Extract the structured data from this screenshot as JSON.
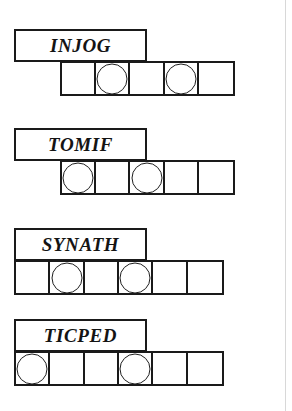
{
  "diagram": {
    "type": "word-cell-grid",
    "cell_size": 35,
    "circle_diameter": 31,
    "sheet_width": 292,
    "sheet_height": 411,
    "colors": {
      "ink": "#1a1a1a",
      "paper": "#ffffff",
      "page_edge": "#d8d8d8"
    },
    "page_edge_x": 285,
    "rows": [
      {
        "id": "row-injog",
        "label": "INJOG",
        "label_box": {
          "x": 14,
          "y": 29,
          "width": 133,
          "height": 33
        },
        "strip": {
          "x": 60,
          "y": 61,
          "cells": 5
        },
        "cells": [
          {
            "index": 1,
            "token": false
          },
          {
            "index": 2,
            "token": true
          },
          {
            "index": 3,
            "token": false
          },
          {
            "index": 4,
            "token": true
          },
          {
            "index": 5,
            "token": false
          }
        ],
        "token_positions": [
          2,
          4
        ],
        "token_count": 2
      },
      {
        "id": "row-tomif",
        "label": "TOMIF",
        "label_box": {
          "x": 14,
          "y": 128,
          "width": 133,
          "height": 33
        },
        "strip": {
          "x": 60,
          "y": 160,
          "cells": 5
        },
        "cells": [
          {
            "index": 1,
            "token": true
          },
          {
            "index": 2,
            "token": false
          },
          {
            "index": 3,
            "token": true
          },
          {
            "index": 4,
            "token": false
          },
          {
            "index": 5,
            "token": false
          }
        ],
        "token_positions": [
          1,
          3
        ],
        "token_count": 2
      },
      {
        "id": "row-synath",
        "label": "SYNATH",
        "label_box": {
          "x": 14,
          "y": 228,
          "width": 133,
          "height": 33
        },
        "strip": {
          "x": 14,
          "y": 260,
          "cells": 6
        },
        "cells": [
          {
            "index": 1,
            "token": false
          },
          {
            "index": 2,
            "token": true
          },
          {
            "index": 3,
            "token": false
          },
          {
            "index": 4,
            "token": true
          },
          {
            "index": 5,
            "token": false
          },
          {
            "index": 6,
            "token": false
          }
        ],
        "token_positions": [
          2,
          4
        ],
        "token_count": 2
      },
      {
        "id": "row-ticped",
        "label": "TICPED",
        "label_box": {
          "x": 14,
          "y": 319,
          "width": 133,
          "height": 33
        },
        "strip": {
          "x": 14,
          "y": 351,
          "cells": 6
        },
        "cells": [
          {
            "index": 1,
            "token": true
          },
          {
            "index": 2,
            "token": false
          },
          {
            "index": 3,
            "token": false
          },
          {
            "index": 4,
            "token": true
          },
          {
            "index": 5,
            "token": false
          },
          {
            "index": 6,
            "token": false
          }
        ],
        "token_positions": [
          1,
          4
        ],
        "token_count": 2
      }
    ]
  }
}
